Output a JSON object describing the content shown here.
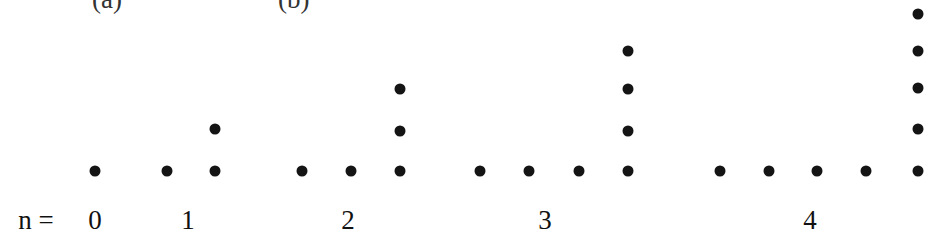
{
  "top_clipped_text": [
    "(a)",
    "(b)"
  ],
  "n_prefix": "n =",
  "groups": [
    {
      "n": "0",
      "label_x": 95,
      "dots": [
        [
          95,
          171
        ]
      ]
    },
    {
      "n": "1",
      "label_x": 188,
      "dots": [
        [
          167,
          171
        ],
        [
          215,
          171
        ],
        [
          215,
          129
        ]
      ]
    },
    {
      "n": "2",
      "label_x": 348,
      "dots": [
        [
          302,
          171
        ],
        [
          351,
          171
        ],
        [
          400,
          171
        ],
        [
          400,
          131
        ],
        [
          400,
          89
        ]
      ]
    },
    {
      "n": "3",
      "label_x": 545,
      "dots": [
        [
          480,
          171
        ],
        [
          529,
          171
        ],
        [
          579,
          171
        ],
        [
          628,
          171
        ],
        [
          628,
          131
        ],
        [
          628,
          89
        ],
        [
          628,
          51
        ]
      ]
    },
    {
      "n": "4",
      "label_x": 810,
      "dots": [
        [
          720,
          171
        ],
        [
          769,
          171
        ],
        [
          817,
          171
        ],
        [
          866,
          171
        ],
        [
          918,
          171
        ],
        [
          918,
          129
        ],
        [
          918,
          88
        ],
        [
          918,
          51
        ],
        [
          918,
          14
        ]
      ]
    }
  ],
  "chart_data": {
    "type": "scatter",
    "title": "",
    "categories": [
      "0",
      "1",
      "2",
      "3",
      "4"
    ],
    "dot_counts": [
      1,
      3,
      5,
      7,
      9
    ],
    "row_counts": [
      1,
      2,
      3,
      4,
      5
    ],
    "column_heights": [
      1,
      2,
      3,
      4,
      5
    ]
  }
}
